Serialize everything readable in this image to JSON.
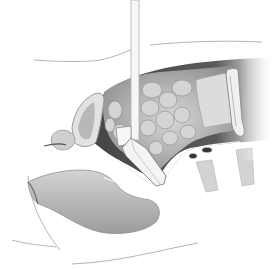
{
  "figure": {
    "type": "anatomical-illustration",
    "style": "grayscale medical cross-section",
    "width": 280,
    "height": 270,
    "caption": "",
    "labels": []
  },
  "colors": {
    "background": "#ffffff",
    "outline": "#9a9a9a",
    "cavity_dark": "#3e3e3e",
    "cavity_mid": "#6c6c6c",
    "bowel_light": "#c9c9c9",
    "bowel_mid": "#a8a8a8",
    "organ_fill": "#bdbdbd",
    "organ_light": "#d9d9d9",
    "instrument": "#f4f4f4",
    "instrument_edge": "#8a8a8a",
    "vertebra": "#d0d0d0",
    "rectum": "#b9b9b9"
  },
  "parts": {
    "instrument_shaft": "retractor-shaft",
    "instrument_blade": "retractor-blade",
    "cavity": "pelvic-cavity",
    "bowel": "small-bowel-loops",
    "colon": "sigmoid-colon",
    "bladder": "bladder",
    "prostate": "prostate",
    "rectum": "rectum",
    "vertebrae": "sacral-vertebrae",
    "skin": "body-wall-outline"
  }
}
